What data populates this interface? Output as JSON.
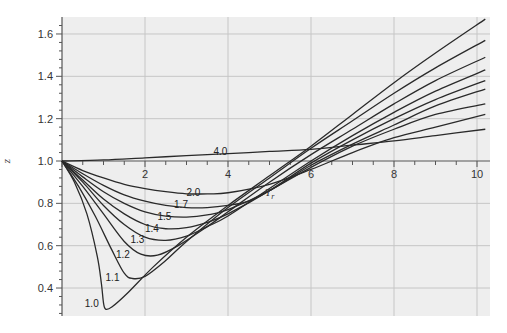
{
  "chart_data": {
    "type": "line",
    "title": "",
    "xlabel": "T_r",
    "ylabel": "z",
    "xlim": [
      0,
      10.3
    ],
    "ylim": [
      0.27,
      1.67
    ],
    "x_axis_at_y": 1.0,
    "x_ticks": [
      2,
      4,
      6,
      8,
      10
    ],
    "x_tick_labels": [
      "2",
      "4",
      "6",
      "8",
      "10"
    ],
    "y_ticks": [
      0.4,
      0.6,
      0.8,
      1.0,
      1.2,
      1.4,
      1.6
    ],
    "y_tick_labels": [
      "0.4",
      "0.6",
      "0.8",
      "1.0",
      "1.2",
      "1.4",
      "1.6"
    ],
    "grid": true,
    "legend": "inline curve labels",
    "series": [
      {
        "name": "1.0",
        "label_at": [
          0.55,
          0.33
        ],
        "x": [
          0,
          0.3,
          0.6,
          0.85,
          0.95,
          1.0,
          1.05,
          1.2,
          1.6,
          2.2,
          3,
          4,
          5,
          6,
          7,
          8,
          9,
          10.2
        ],
        "y": [
          1.0,
          0.9,
          0.75,
          0.55,
          0.42,
          0.33,
          0.3,
          0.31,
          0.38,
          0.5,
          0.64,
          0.79,
          0.93,
          1.07,
          1.22,
          1.37,
          1.51,
          1.67
        ]
      },
      {
        "name": "1.1",
        "label_at": [
          1.05,
          0.45
        ],
        "x": [
          0,
          0.4,
          0.8,
          1.2,
          1.5,
          1.7,
          2.0,
          2.5,
          3,
          4,
          5,
          6,
          7,
          8,
          9,
          10.2
        ],
        "y": [
          1.0,
          0.88,
          0.74,
          0.58,
          0.47,
          0.445,
          0.455,
          0.53,
          0.62,
          0.78,
          0.92,
          1.06,
          1.19,
          1.32,
          1.44,
          1.57
        ]
      },
      {
        "name": "1.2",
        "label_at": [
          1.3,
          0.56
        ],
        "x": [
          0,
          0.5,
          1.0,
          1.5,
          1.9,
          2.3,
          2.8,
          3.5,
          4,
          5,
          6,
          7,
          8,
          9,
          10.2
        ],
        "y": [
          1.0,
          0.88,
          0.75,
          0.62,
          0.56,
          0.555,
          0.6,
          0.69,
          0.76,
          0.9,
          1.03,
          1.15,
          1.27,
          1.38,
          1.49
        ]
      },
      {
        "name": "1.3",
        "label_at": [
          1.65,
          0.63
        ],
        "x": [
          0,
          0.5,
          1.0,
          1.5,
          2.0,
          2.5,
          3.0,
          3.5,
          4,
          5,
          6,
          7,
          8,
          9,
          10.2
        ],
        "y": [
          1.0,
          0.9,
          0.79,
          0.7,
          0.64,
          0.625,
          0.645,
          0.69,
          0.74,
          0.87,
          1.0,
          1.12,
          1.23,
          1.33,
          1.43
        ]
      },
      {
        "name": "1.4",
        "label_at": [
          2.0,
          0.685
        ],
        "x": [
          0,
          0.5,
          1.0,
          1.5,
          2.0,
          2.5,
          3.0,
          3.5,
          4,
          5,
          6,
          7,
          8,
          9,
          10.2
        ],
        "y": [
          1.0,
          0.91,
          0.82,
          0.75,
          0.7,
          0.68,
          0.685,
          0.71,
          0.75,
          0.86,
          0.99,
          1.1,
          1.2,
          1.29,
          1.38
        ]
      },
      {
        "name": "1.5",
        "label_at": [
          2.3,
          0.74
        ],
        "x": [
          0,
          0.5,
          1.0,
          1.5,
          2.0,
          2.5,
          3.0,
          3.5,
          4,
          5,
          6,
          7,
          8,
          9,
          10.2
        ],
        "y": [
          1.0,
          0.925,
          0.855,
          0.8,
          0.76,
          0.74,
          0.735,
          0.745,
          0.77,
          0.86,
          0.98,
          1.08,
          1.17,
          1.26,
          1.34
        ]
      },
      {
        "name": "1.7",
        "label_at": [
          2.7,
          0.795
        ],
        "x": [
          0,
          0.5,
          1.0,
          1.5,
          2.0,
          2.5,
          3.0,
          3.5,
          4,
          4.5,
          5,
          6,
          7,
          8,
          9,
          10.2
        ],
        "y": [
          1.0,
          0.94,
          0.885,
          0.84,
          0.81,
          0.79,
          0.78,
          0.78,
          0.79,
          0.81,
          0.86,
          0.97,
          1.07,
          1.15,
          1.22,
          1.27
        ]
      },
      {
        "name": "2.0",
        "label_at": [
          3.0,
          0.855
        ],
        "x": [
          0,
          0.5,
          1.0,
          1.5,
          2.0,
          2.5,
          3.0,
          3.5,
          4,
          5,
          6,
          7,
          8,
          9,
          10.2
        ],
        "y": [
          1.0,
          0.955,
          0.92,
          0.89,
          0.87,
          0.855,
          0.845,
          0.845,
          0.85,
          0.89,
          0.96,
          1.04,
          1.11,
          1.16,
          1.22
        ]
      },
      {
        "name": "4.0",
        "label_at": [
          3.65,
          1.045
        ],
        "x": [
          0,
          1,
          2,
          3,
          4,
          5,
          6,
          7,
          8,
          9,
          10.2
        ],
        "y": [
          1.0,
          1.005,
          1.015,
          1.025,
          1.035,
          1.045,
          1.055,
          1.075,
          1.095,
          1.12,
          1.15
        ]
      }
    ]
  },
  "axis": {
    "x_title_main": "T",
    "x_title_sub": "r",
    "y_title": "z"
  },
  "colors": {
    "plot_bg": "#eeeeee",
    "grid": "#c6c6c6",
    "axis": "#555555",
    "curve": "#2a2a2a"
  }
}
